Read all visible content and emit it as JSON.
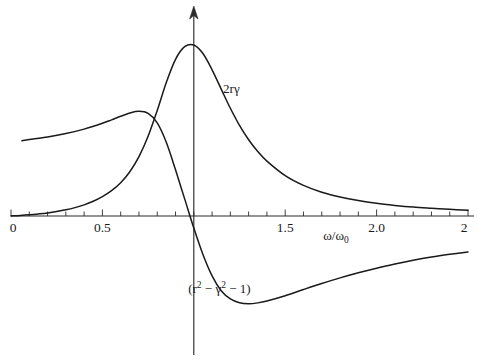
{
  "figure": {
    "background_color": "#ffffff",
    "ink_color": "#1a1a1a"
  },
  "chart_data": {
    "type": "line",
    "title": "",
    "subtitle": "",
    "xlabel": "ω/ω₀",
    "ylabel": "",
    "xlim": [
      0,
      2.5
    ],
    "ylim": [
      -0.62,
      1.05
    ],
    "grid": false,
    "legend_position": "inline-annotations",
    "x_ticks_major": [
      "0",
      "0.5",
      "1.5",
      "2.0",
      "2"
    ],
    "x_tick_values_major": [
      0,
      0.5,
      1.5,
      2.0,
      2.5
    ],
    "x_tick_minor_step": 0.1,
    "axis_origin_value": 0,
    "vertical_axis_at_x": 1.0,
    "annotations": [
      {
        "name": "absorption-curve-label",
        "text": "2rγ",
        "text_parts": [
          "2r",
          "γ"
        ],
        "x": 1.16,
        "y": 0.72
      },
      {
        "name": "dispersion-curve-label",
        "text": "(r² − γ² − 1)",
        "base_left": "(r",
        "sup_1": "2",
        "mid_1": "− γ",
        "sup_2": "2",
        "mid_2": "− 1)",
        "x": 1.14,
        "y": -0.45
      }
    ],
    "series": [
      {
        "name": "absorption",
        "label": "2rγ",
        "description": "Lorentzian absorption resonance peaking at ω/ω₀ = 1",
        "color": "#1a1a1a",
        "x": [
          0.0,
          0.05,
          0.1,
          0.15,
          0.2,
          0.25,
          0.3,
          0.35,
          0.4,
          0.45,
          0.5,
          0.55,
          0.6,
          0.65,
          0.7,
          0.75,
          0.8,
          0.85,
          0.9,
          0.95,
          1.0,
          1.05,
          1.1,
          1.15,
          1.2,
          1.25,
          1.3,
          1.35,
          1.4,
          1.5,
          1.6,
          1.7,
          1.8,
          1.9,
          2.0,
          2.1,
          2.2,
          2.3,
          2.4,
          2.5
        ],
        "y": [
          0.0,
          0.003,
          0.007,
          0.012,
          0.018,
          0.026,
          0.036,
          0.049,
          0.065,
          0.086,
          0.113,
          0.148,
          0.195,
          0.259,
          0.347,
          0.466,
          0.617,
          0.782,
          0.916,
          0.99,
          1.0,
          0.95,
          0.855,
          0.742,
          0.63,
          0.53,
          0.446,
          0.377,
          0.321,
          0.236,
          0.179,
          0.139,
          0.111,
          0.09,
          0.074,
          0.062,
          0.052,
          0.045,
          0.039,
          0.034
        ]
      },
      {
        "name": "dispersion",
        "label": "(r² − γ² − 1)",
        "description": "Dispersion curve crossing zero at ω/ω₀ = 1",
        "color": "#1a1a1a",
        "x": [
          0.06,
          0.1,
          0.2,
          0.3,
          0.4,
          0.5,
          0.55,
          0.6,
          0.65,
          0.7,
          0.75,
          0.8,
          0.85,
          0.9,
          0.95,
          1.0,
          1.05,
          1.1,
          1.15,
          1.2,
          1.25,
          1.3,
          1.35,
          1.4,
          1.5,
          1.6,
          1.7,
          1.8,
          1.9,
          2.0,
          2.1,
          2.2,
          2.3,
          2.4,
          2.5
        ],
        "y": [
          0.44,
          0.447,
          0.462,
          0.482,
          0.508,
          0.542,
          0.562,
          0.583,
          0.602,
          0.612,
          0.6,
          0.545,
          0.43,
          0.27,
          0.1,
          -0.07,
          -0.225,
          -0.35,
          -0.437,
          -0.485,
          -0.507,
          -0.513,
          -0.508,
          -0.497,
          -0.466,
          -0.43,
          -0.395,
          -0.362,
          -0.332,
          -0.305,
          -0.281,
          -0.259,
          -0.24,
          -0.224,
          -0.21
        ]
      }
    ]
  }
}
